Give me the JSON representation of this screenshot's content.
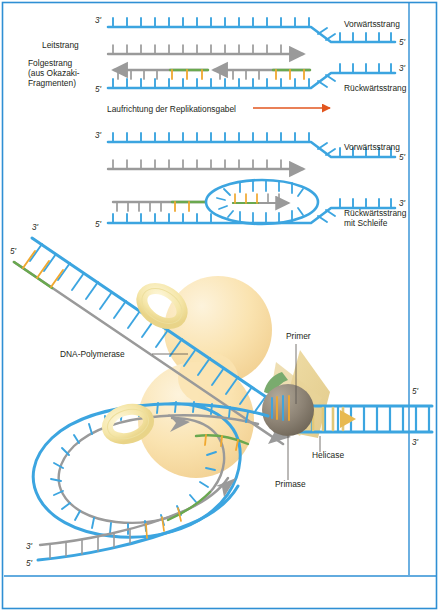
{
  "figure": {
    "language": "de",
    "background_color": "#ffffff",
    "frame_color": "#2e8fd4"
  },
  "colors": {
    "template_strand": "#3ca5e0",
    "new_strand": "#9a9a9a",
    "rna_primer_backbone": "#6aa84f",
    "rna_primer_rungs": "#f0a830",
    "polymerase_body": "#fae3b0",
    "sliding_clamp": "#f5e6a8",
    "helicase_wedge": "#e6cf8e",
    "primase_sphere": "#8c8274",
    "primase_collar": "#7aab6e",
    "direction_arrow": "#e2561f",
    "text": "#231f20",
    "leader_line": "#55504d"
  },
  "panels": [
    {
      "id": "panel-1",
      "name": "Replikationsgabel ohne Schleife",
      "labels_left": [
        {
          "id": "leitstrang",
          "text": "Leitstrang"
        },
        {
          "id": "folgestrang",
          "lines": [
            "Folgestrang",
            "(aus Okazaki-",
            "Fragmenten)"
          ]
        }
      ],
      "labels_right": [
        {
          "id": "vorwaertsstrang",
          "text": "Vorwärtsstrang"
        },
        {
          "id": "rueckwaertsstrang",
          "text": "Rückwärtsstrang"
        }
      ],
      "end_labels": [
        {
          "id": "p1-top-left",
          "text": "3'"
        },
        {
          "id": "p1-bottom-left",
          "text": "5'"
        },
        {
          "id": "p1-top-right",
          "text": "5'"
        },
        {
          "id": "p1-bottom-right",
          "text": "3'"
        }
      ]
    },
    {
      "id": "direction-annotation",
      "name": "Laufrichtung der Replikationsgabel",
      "text": "Laufrichtung der Replikationsgabel",
      "arrow": "right"
    },
    {
      "id": "panel-2",
      "name": "Replikationsgabel mit Schleife",
      "labels_right": [
        {
          "id": "vorwaertsstrang-2",
          "text": "Vorwärtsstrang"
        },
        {
          "id": "rueckwaertsstrang-2",
          "lines": [
            "Rückwärtsstrang",
            "mit Schleife"
          ]
        }
      ],
      "end_labels": [
        {
          "id": "p2-top-left",
          "text": "3'"
        },
        {
          "id": "p2-bottom-left",
          "text": "5'"
        },
        {
          "id": "p2-top-right",
          "text": "5'"
        },
        {
          "id": "p2-bottom-right",
          "text": "3'"
        }
      ]
    },
    {
      "id": "panel-3",
      "name": "Replisom in 3D-Ansicht",
      "callouts": [
        {
          "id": "dna-polymerase",
          "text": "DNA-Polymerase"
        },
        {
          "id": "primer",
          "text": "Primer"
        },
        {
          "id": "helicase",
          "text": "Helicase"
        },
        {
          "id": "primase",
          "text": "Primase"
        }
      ],
      "end_labels": [
        {
          "id": "p3-diag-3prime",
          "text": "3'"
        },
        {
          "id": "p3-diag-5prime",
          "text": "5'"
        },
        {
          "id": "p3-right-5prime",
          "text": "5'"
        },
        {
          "id": "p3-right-3prime",
          "text": "3'"
        },
        {
          "id": "p3-bottom-3prime",
          "text": "3'"
        },
        {
          "id": "p3-bottom-5prime",
          "text": "5'"
        }
      ]
    }
  ]
}
